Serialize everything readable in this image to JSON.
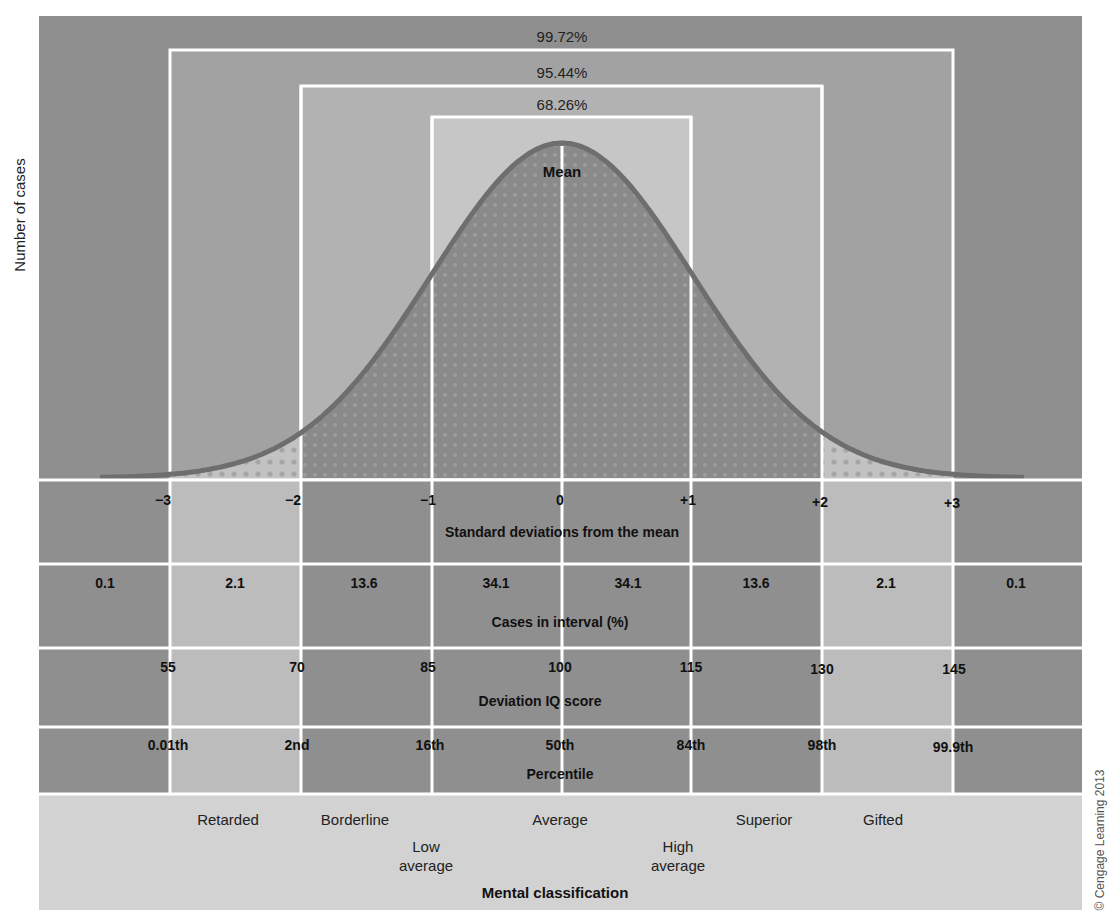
{
  "figure": {
    "y_axis_label": "Number of cases",
    "mean_label": "Mean",
    "copyright": "© Cengage Learning 2013",
    "coverage_boxes": [
      {
        "label": "99.72%",
        "range": "-3 to +3 SD"
      },
      {
        "label": "95.44%",
        "range": "-2 to +2 SD"
      },
      {
        "label": "68.26%",
        "range": "-1 to +1 SD"
      }
    ],
    "rows": {
      "sd": {
        "title": "Standard deviations from the mean",
        "ticks": [
          "−3",
          "−2",
          "−1",
          "0",
          "+1",
          "+2",
          "+3"
        ]
      },
      "cases": {
        "title": "Cases in interval (%)",
        "values": [
          "0.1",
          "2.1",
          "13.6",
          "34.1",
          "34.1",
          "13.6",
          "2.1",
          "0.1"
        ]
      },
      "iq": {
        "title": "Deviation IQ score",
        "ticks": [
          "55",
          "70",
          "85",
          "100",
          "115",
          "130",
          "145"
        ]
      },
      "percentile": {
        "title": "Percentile",
        "ticks": [
          "0.01th",
          "2nd",
          "16th",
          "50th",
          "84th",
          "98th",
          "99.9th"
        ]
      },
      "classification": {
        "title": "Mental classification",
        "labels": [
          {
            "line1": "Retarded",
            "line2": ""
          },
          {
            "line1": "Borderline",
            "line2": ""
          },
          {
            "line1": "Low",
            "line2": "average"
          },
          {
            "line1": "Average",
            "line2": ""
          },
          {
            "line1": "High",
            "line2": "average"
          },
          {
            "line1": "Superior",
            "line2": ""
          },
          {
            "line1": "Gifted",
            "line2": ""
          }
        ]
      }
    },
    "colors": {
      "outer": "#8f8f8f",
      "box99": "#a2a2a2",
      "box95": "#b2b2b2",
      "box68": "#c6c6c6",
      "curve_stroke": "#6e6e6e",
      "curve_fill": "#8a8a8a",
      "tail_fill": "#bdbdbd",
      "light_cell": "#bcbcbc",
      "dark_cell": "#8f8f8f",
      "class_band": "#d2d2d2",
      "grid_line": "#ffffff"
    }
  },
  "chart_data": {
    "type": "area",
    "xlabel": "Standard deviations from the mean",
    "ylabel": "Number of cases",
    "x": [
      -3,
      -2,
      -1,
      0,
      1,
      2,
      3
    ],
    "interval_percentages": {
      "categories": [
        "<-3",
        "-3 to -2",
        "-2 to -1",
        "-1 to 0",
        "0 to +1",
        "+1 to +2",
        "+2 to +3",
        ">+3"
      ],
      "values": [
        0.1,
        2.1,
        13.6,
        34.1,
        34.1,
        13.6,
        2.1,
        0.1
      ]
    },
    "coverage": {
      "within_1sd": 68.26,
      "within_2sd": 95.44,
      "within_3sd": 99.72
    },
    "iq_scores": [
      55,
      70,
      85,
      100,
      115,
      130,
      145
    ],
    "percentiles": [
      "0.01th",
      "2nd",
      "16th",
      "50th",
      "84th",
      "98th",
      "99.9th"
    ],
    "classifications": [
      "Retarded",
      "Borderline",
      "Low average",
      "Average",
      "High average",
      "Superior",
      "Gifted"
    ],
    "grid": true,
    "legend": "none"
  }
}
